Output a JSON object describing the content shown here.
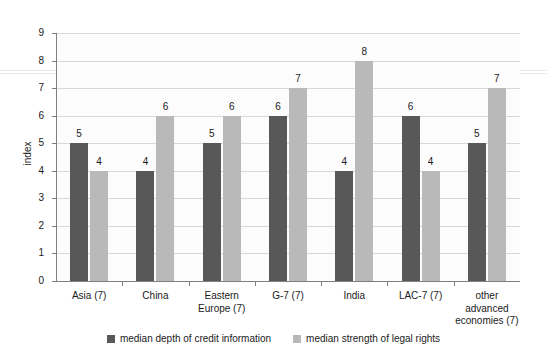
{
  "chart_data": {
    "type": "bar",
    "title": "",
    "xlabel": "",
    "ylabel": "index",
    "ylim": [
      0,
      9
    ],
    "yticks": [
      0,
      1,
      2,
      3,
      4,
      5,
      6,
      7,
      8,
      9
    ],
    "grid": true,
    "legend_position": "bottom",
    "categories": [
      "Asia (7)",
      "China",
      "Eastern Europe (7)",
      "G-7 (7)",
      "India",
      "LAC-7 (7)",
      "other advanced economies (7)"
    ],
    "category_lines": [
      [
        "Asia (7)"
      ],
      [
        "China"
      ],
      [
        "Eastern",
        "Europe (7)"
      ],
      [
        "G-7 (7)"
      ],
      [
        "India"
      ],
      [
        "LAC-7 (7)"
      ],
      [
        "other",
        "advanced",
        "economies (7)"
      ]
    ],
    "series": [
      {
        "name": "median depth of credit information",
        "color": "#585858",
        "values": [
          5,
          4,
          5,
          6,
          4,
          6,
          5
        ]
      },
      {
        "name": "median strength of legal rights",
        "color": "#b9b9b9",
        "values": [
          4,
          6,
          6,
          7,
          8,
          4,
          7
        ]
      }
    ]
  },
  "axis": {
    "y_label": "index",
    "y_tick_labels": [
      "0",
      "1",
      "2",
      "3",
      "4",
      "5",
      "6",
      "7",
      "8",
      "9"
    ]
  },
  "legend": {
    "items": [
      {
        "label": "median depth of credit information",
        "color": "#585858"
      },
      {
        "label": "median strength of legal rights",
        "color": "#b9b9b9"
      }
    ]
  },
  "colors": {
    "series_dark": "#585858",
    "series_light": "#b9b9b9",
    "gridline": "#d8d8d8",
    "axis": "#808080",
    "plot_background": "#fcfcfc",
    "page_background": "#ffffff",
    "text": "#1a1a1a"
  }
}
